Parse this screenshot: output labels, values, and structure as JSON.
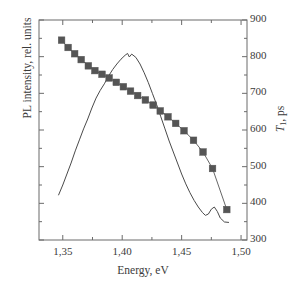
{
  "figure": {
    "xlabel": "Energy, eV",
    "ylabel_left": "PL intensity, rel. units",
    "ylabel_right_main": "T",
    "ylabel_right_sub": "1",
    "ylabel_right_tail": ", ps",
    "xticks": [
      "1,35",
      "1,40",
      "1,45",
      "1,50"
    ],
    "yticks_right": [
      "900",
      "800",
      "700",
      "600",
      "500",
      "400",
      "300"
    ],
    "colors": {
      "axis": "#6b6b6b",
      "line": "#4a4a4a",
      "marker": "#555555",
      "text": "#3b3b3b",
      "background": "#ffffff"
    }
  },
  "chart_data": {
    "type": "line",
    "title": "",
    "xlabel": "Energy, eV",
    "ylabel": "PL intensity, rel. units",
    "ylabel_secondary": "T1, ps",
    "xlim": [
      1.33,
      1.505
    ],
    "ylim_secondary": [
      300,
      900
    ],
    "xticks": [
      1.35,
      1.4,
      1.45,
      1.5
    ],
    "xtick_labels": [
      "1,35",
      "1,40",
      "1,45",
      "1,50"
    ],
    "yticks_secondary": [
      300,
      400,
      500,
      600,
      700,
      800,
      900
    ],
    "ytick_labels_secondary": [
      "300",
      "400",
      "500",
      "600",
      "700",
      "800",
      "900"
    ],
    "yticks_left_labeled": false,
    "minor_ticks": true,
    "grid": false,
    "legend": null,
    "series": [
      {
        "name": "PL intensity",
        "axis": "left",
        "style": "line",
        "marker": "none",
        "color": "#4a4a4a",
        "x": [
          1.3465,
          1.35,
          1.3535,
          1.357,
          1.3605,
          1.364,
          1.3675,
          1.371,
          1.3745,
          1.378,
          1.3815,
          1.385,
          1.3885,
          1.392,
          1.3955,
          1.399,
          1.4025,
          1.4045,
          1.406,
          1.408,
          1.4115,
          1.415,
          1.4185,
          1.422,
          1.4255,
          1.429,
          1.4325,
          1.436,
          1.4395,
          1.443,
          1.4465,
          1.45,
          1.4535,
          1.457,
          1.4605,
          1.464,
          1.4675,
          1.47,
          1.4725,
          1.475,
          1.4775,
          1.48,
          1.4825,
          1.486,
          1.4895
        ],
        "y": [
          0.205,
          0.25,
          0.3,
          0.35,
          0.405,
          0.455,
          0.505,
          0.55,
          0.6,
          0.645,
          0.68,
          0.71,
          0.745,
          0.775,
          0.8,
          0.822,
          0.84,
          0.848,
          0.832,
          0.845,
          0.83,
          0.8,
          0.76,
          0.715,
          0.665,
          0.615,
          0.56,
          0.505,
          0.45,
          0.4,
          0.35,
          0.3,
          0.255,
          0.215,
          0.18,
          0.15,
          0.125,
          0.112,
          0.118,
          0.14,
          0.15,
          0.13,
          0.1,
          0.082,
          0.08
        ]
      },
      {
        "name": "T1 lifetime",
        "axis": "right",
        "style": "line+markers",
        "marker": "square",
        "color": "#555555",
        "x": [
          1.349,
          1.3545,
          1.36,
          1.3655,
          1.3715,
          1.377,
          1.383,
          1.389,
          1.395,
          1.401,
          1.407,
          1.413,
          1.4195,
          1.426,
          1.432,
          1.4385,
          1.445,
          1.452,
          1.46,
          1.468,
          1.476,
          1.488
        ],
        "y": [
          845,
          825,
          808,
          792,
          775,
          762,
          752,
          742,
          730,
          718,
          706,
          694,
          682,
          668,
          652,
          636,
          618,
          598,
          572,
          540,
          495,
          383
        ]
      }
    ],
    "annotations": [
      {
        "text": "PL peak",
        "x": 1.4045,
        "note": "small notch at apex near 1.4045-1.4080 eV"
      },
      {
        "text": "shoulder",
        "x": 1.476,
        "note": "local bump in PL curve near 1.476 eV"
      },
      {
        "text": "curve crossing",
        "x": 1.4325,
        "note": "PL line crosses T1 marker series"
      }
    ]
  }
}
